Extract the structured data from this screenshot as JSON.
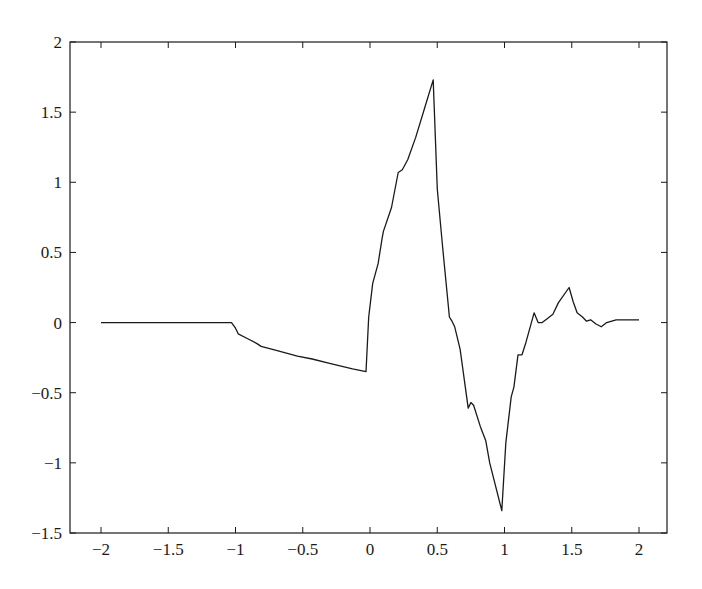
{
  "chart_data": {
    "type": "line",
    "title": "",
    "xlabel": "",
    "ylabel": "",
    "xlim": [
      -2.25,
      2.2
    ],
    "ylim": [
      -1.5,
      2
    ],
    "grid": false,
    "legend": null,
    "xticks": [
      -2,
      -1.5,
      -1,
      -0.5,
      0,
      0.5,
      1,
      1.5,
      2
    ],
    "xtick_labels": [
      "−2",
      "−1.5",
      "−1",
      "−0.5",
      "0",
      "0.5",
      "1",
      "1.5",
      "2"
    ],
    "yticks": [
      -1.5,
      -1,
      -0.5,
      0,
      0.5,
      1,
      1.5,
      2
    ],
    "ytick_labels": [
      "−1.5",
      "−1",
      "−0.5",
      "0",
      "0.5",
      "1",
      "1.5",
      "2"
    ],
    "series": [
      {
        "name": "signal",
        "color": "#1a1a1a",
        "x": [
          -2.0,
          -1.03,
          -1.0,
          -0.98,
          -0.92,
          -0.84,
          -0.81,
          -0.69,
          -0.54,
          -0.43,
          -0.3,
          -0.13,
          -0.03,
          -0.01,
          0.02,
          0.06,
          0.09,
          0.1,
          0.16,
          0.21,
          0.24,
          0.28,
          0.34,
          0.41,
          0.47,
          0.5,
          0.54,
          0.59,
          0.61,
          0.63,
          0.67,
          0.73,
          0.75,
          0.77,
          0.82,
          0.86,
          0.89,
          0.98,
          1.01,
          1.05,
          1.07,
          1.1,
          1.13,
          1.16,
          1.22,
          1.25,
          1.28,
          1.32,
          1.36,
          1.4,
          1.48,
          1.51,
          1.54,
          1.58,
          1.61,
          1.64,
          1.68,
          1.72,
          1.76,
          1.83,
          1.87,
          2.0
        ],
        "y": [
          0.0,
          0.0,
          -0.04,
          -0.08,
          -0.11,
          -0.15,
          -0.17,
          -0.2,
          -0.24,
          -0.26,
          -0.29,
          -0.33,
          -0.35,
          0.04,
          0.28,
          0.42,
          0.6,
          0.65,
          0.82,
          1.07,
          1.09,
          1.16,
          1.32,
          1.54,
          1.73,
          0.95,
          0.54,
          0.04,
          0.01,
          -0.03,
          -0.19,
          -0.61,
          -0.57,
          -0.59,
          -0.74,
          -0.84,
          -1.0,
          -1.34,
          -0.86,
          -0.53,
          -0.46,
          -0.23,
          -0.23,
          -0.14,
          0.07,
          0.0,
          0.0,
          0.03,
          0.06,
          0.14,
          0.25,
          0.15,
          0.07,
          0.04,
          0.01,
          0.02,
          -0.01,
          -0.03,
          0.0,
          0.02,
          0.02,
          0.02
        ]
      }
    ]
  }
}
